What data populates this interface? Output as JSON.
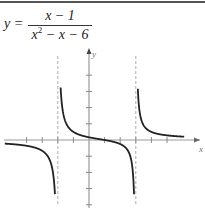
{
  "equation": {
    "lhs": "y =",
    "numerator": "x − 1",
    "denominator_base": "x",
    "denominator_exp": "2",
    "denominator_rest": " − x − 6"
  },
  "graph": {
    "x_axis_label": "x",
    "y_axis_label": "y",
    "vertical_asymptotes": [
      -2,
      3
    ],
    "horizontal_asymptote": 0,
    "x_ticks": [
      -4,
      -3,
      -2,
      -1,
      1,
      2,
      3,
      4,
      5
    ],
    "y_ticks": [
      -4,
      -3,
      -2,
      -1,
      1,
      2,
      3,
      4
    ],
    "curve_color": "#222222",
    "axis_color": "#999999"
  }
}
